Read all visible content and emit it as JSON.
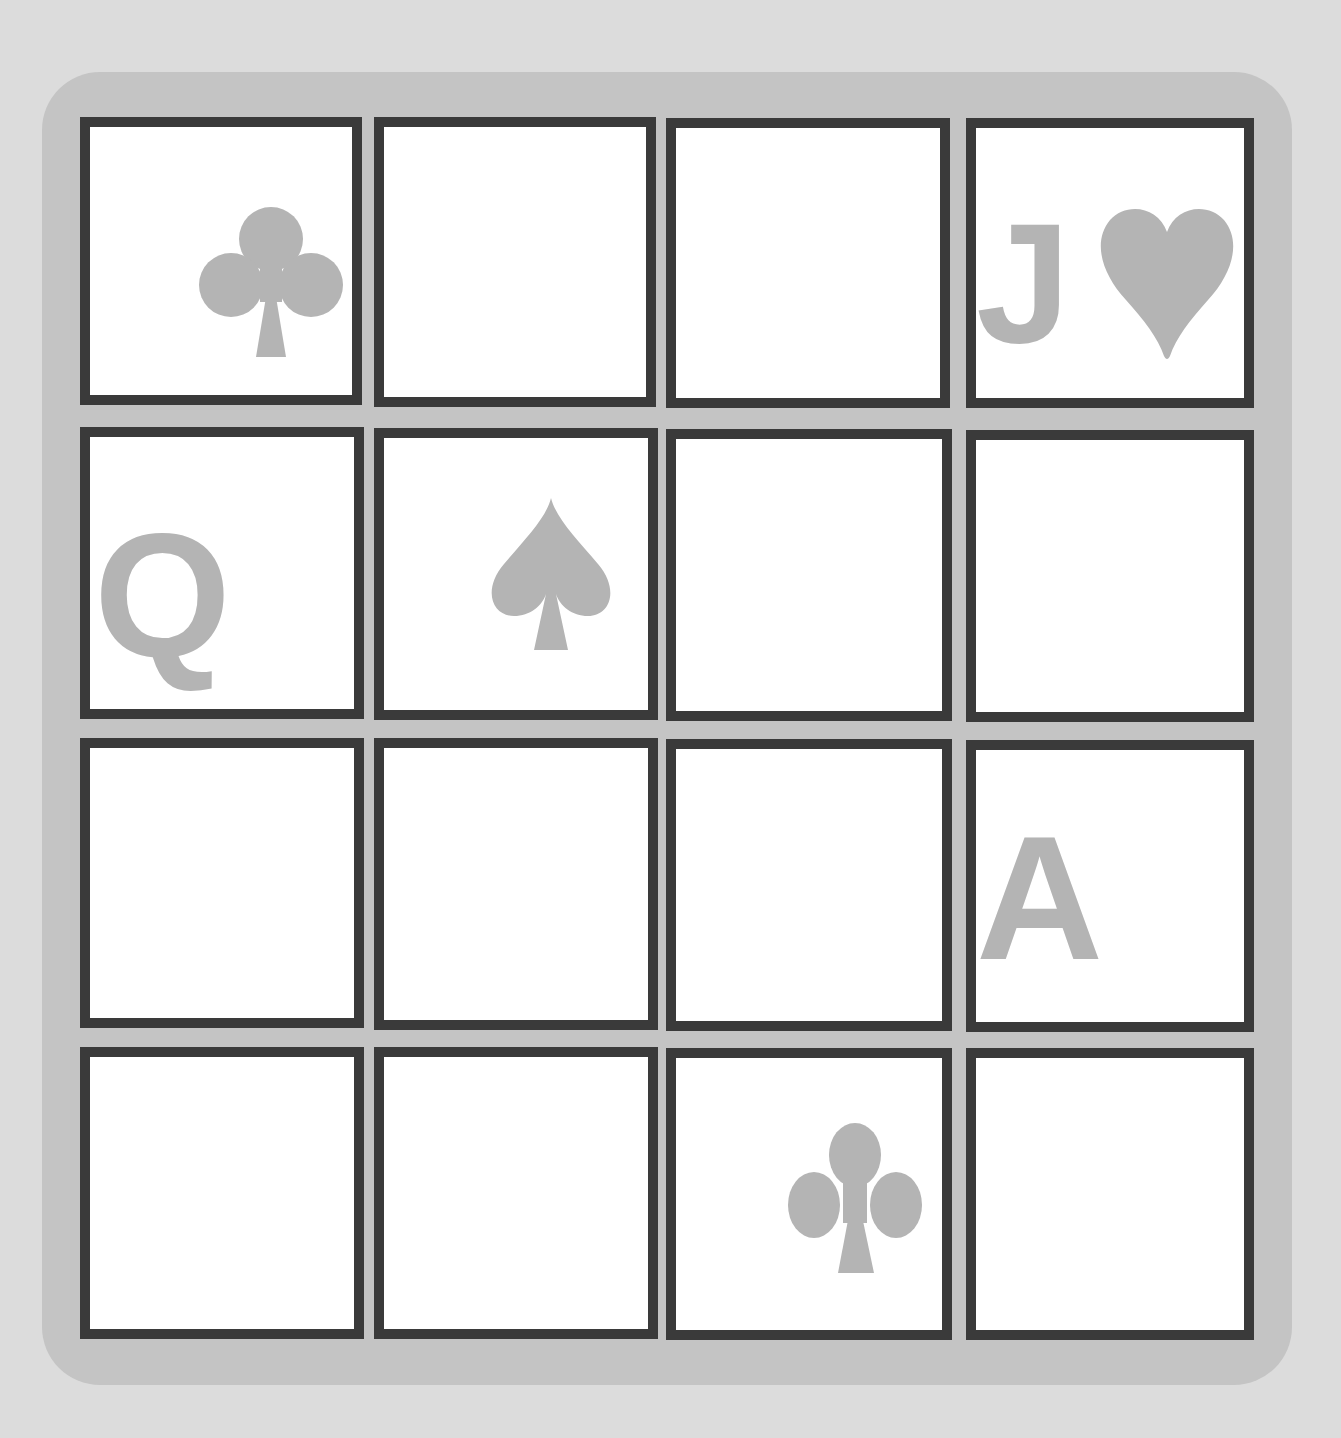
{
  "game": {
    "title": "",
    "grid": {
      "rows": 4,
      "cols": 4
    },
    "colors": {
      "background": "#dcdcdc",
      "board": "#c4c4c4",
      "cell_border": "#3a3a3a",
      "cell_fill": "#ffffff",
      "symbol": "#b4b4b4"
    },
    "cells": [
      [
        {
          "rank": "",
          "suit": "club"
        },
        {
          "rank": "",
          "suit": ""
        },
        {
          "rank": "",
          "suit": ""
        },
        {
          "rank": "J",
          "suit": "heart"
        }
      ],
      [
        {
          "rank": "Q",
          "suit": ""
        },
        {
          "rank": "",
          "suit": "spade"
        },
        {
          "rank": "",
          "suit": ""
        },
        {
          "rank": "",
          "suit": ""
        }
      ],
      [
        {
          "rank": "",
          "suit": ""
        },
        {
          "rank": "",
          "suit": ""
        },
        {
          "rank": "",
          "suit": ""
        },
        {
          "rank": "A",
          "suit": ""
        }
      ],
      [
        {
          "rank": "",
          "suit": ""
        },
        {
          "rank": "",
          "suit": ""
        },
        {
          "rank": "",
          "suit": "club"
        },
        {
          "rank": "",
          "suit": ""
        }
      ]
    ]
  }
}
